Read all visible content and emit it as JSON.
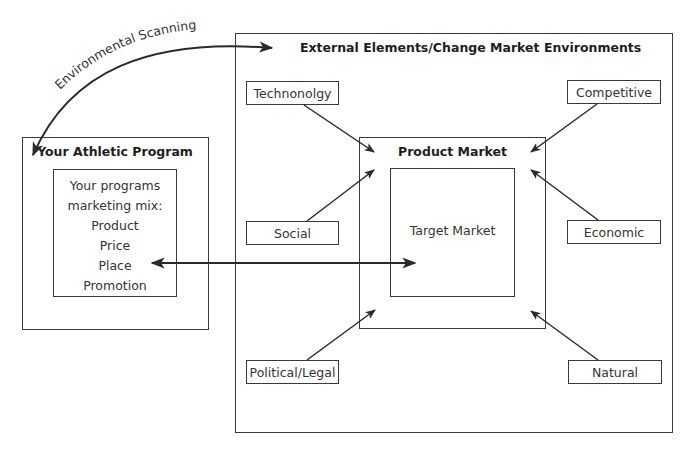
{
  "diagram": {
    "curve_label": "Environmental Scanning",
    "external": {
      "title": "External Elements/Change Market Environments",
      "factors": {
        "technology": "Technonolgy",
        "competitive": "Competitive",
        "social": "Social",
        "economic": "Economic",
        "political": "Political/Legal",
        "natural": "Natural"
      }
    },
    "product_market": {
      "title": "Product Market",
      "target": "Target Market"
    },
    "athletic_program": {
      "title": "Your Athletic Program",
      "mix_lines": [
        "Your programs",
        "marketing mix:",
        "Product",
        "Price",
        "Place",
        "Promotion"
      ]
    },
    "colors": {
      "line": "#2a2a2a",
      "border": "#3a3a3a",
      "background": "#ffffff"
    }
  }
}
